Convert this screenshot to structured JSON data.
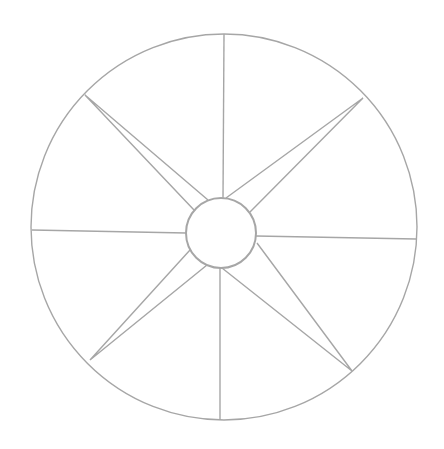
{
  "diagram": {
    "type": "compass-star-wheel",
    "stroke_color": "#a6a6a6",
    "background": "#ffffff",
    "outer_circle": {
      "cx": 224,
      "cy": 227,
      "r": 193
    },
    "inner_circle": {
      "cx": 221,
      "cy": 233,
      "r": 35
    },
    "spokes": [
      {
        "name": "north",
        "x1": 223,
        "y1": 198,
        "x2": 224,
        "y2": 34
      },
      {
        "name": "south",
        "x1": 220,
        "y1": 268,
        "x2": 220,
        "y2": 420
      },
      {
        "name": "west",
        "x1": 186,
        "y1": 233,
        "x2": 32,
        "y2": 230
      },
      {
        "name": "east",
        "x1": 256,
        "y1": 236,
        "x2": 416,
        "y2": 239
      }
    ],
    "star_points": [
      {
        "name": "northwest",
        "tip": [
          85,
          95
        ],
        "base_a": [
          208,
          200
        ],
        "base_b": [
          194,
          210
        ]
      },
      {
        "name": "northeast",
        "tip": [
          363,
          98
        ],
        "base_a": [
          226,
          198
        ],
        "base_b": [
          250,
          212
        ]
      },
      {
        "name": "southwest",
        "tip": [
          90,
          360
        ],
        "base_a": [
          190,
          250
        ],
        "base_b": [
          207,
          265
        ]
      },
      {
        "name": "southeast",
        "tip": [
          352,
          371
        ],
        "base_a": [
          257,
          243
        ],
        "base_b": [
          222,
          268
        ]
      }
    ]
  }
}
